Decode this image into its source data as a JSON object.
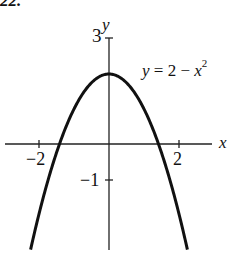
{
  "problem_number": "22.",
  "chart_data": {
    "type": "line",
    "title": "",
    "equation_label": "y = 2 − x²",
    "xlabel": "x",
    "ylabel": "y",
    "function": "y = 2 - x^2",
    "x_ticks": [
      -2,
      2
    ],
    "x_tick_labels": [
      "−2",
      "2"
    ],
    "y_ticks": [
      -1,
      3
    ],
    "y_tick_labels": [
      "−1",
      "3"
    ],
    "xlim": [
      -2.9,
      3.3
    ],
    "ylim": [
      -3.0,
      3.0
    ],
    "grid": false,
    "legend": "none",
    "series": [
      {
        "name": "y = 2 − x²",
        "x": [
          -2.24,
          -2,
          -1.5,
          -1.414,
          -1,
          -0.5,
          0,
          0.5,
          1,
          1.414,
          1.5,
          2,
          2.24
        ],
        "y": [
          -3.0,
          -2,
          -0.25,
          0,
          1,
          1.75,
          2,
          1.75,
          1,
          0,
          -0.25,
          -2,
          -3.0
        ]
      }
    ],
    "vertex": [
      0,
      2
    ],
    "x_intercepts": [
      -1.414,
      1.414
    ]
  },
  "labels": {
    "x_axis": "x",
    "y_axis": "y",
    "tick_x_neg2": "−2",
    "tick_x_2": "2",
    "tick_y_neg1": "−1",
    "tick_y_3": "3",
    "eq_y": "y",
    "eq_rest": " = 2 − ",
    "eq_x": "x",
    "eq_exp": "2"
  }
}
